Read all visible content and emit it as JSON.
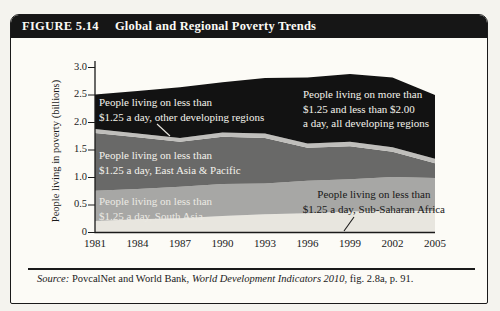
{
  "figure": {
    "label": "FIGURE 5.14",
    "title": "Global and Regional Poverty Trends"
  },
  "chart_data": {
    "type": "area",
    "stacked": true,
    "title": "Global and Regional Poverty Trends",
    "xlabel": "",
    "ylabel": "People living in poverty (billions)",
    "x": [
      1981,
      1984,
      1987,
      1990,
      1993,
      1996,
      1999,
      2002,
      2005
    ],
    "ylim": [
      0,
      3.0
    ],
    "yticks": [
      {
        "value": 0,
        "label": "0"
      },
      {
        "value": 0.5,
        "label": "0.5"
      },
      {
        "value": 1.0,
        "label": "1.0"
      },
      {
        "value": 1.5,
        "label": "1.5"
      },
      {
        "value": 2.0,
        "label": "2.0"
      },
      {
        "value": 2.5,
        "label": "2.5"
      },
      {
        "value": 3.0,
        "label": "3.0"
      }
    ],
    "grid": false,
    "legend": "labels-inside-areas",
    "series": [
      {
        "name": "sub-saharan-africa",
        "label": "People living on less than\n$1.25 a day, Sub-Saharan Africa",
        "color": "#e8e6df",
        "values": [
          0.21,
          0.24,
          0.26,
          0.3,
          0.33,
          0.35,
          0.38,
          0.39,
          0.39
        ]
      },
      {
        "name": "south-asia",
        "label": "People living on less than\n$1.25 a day, South Asia",
        "color": "#a7a7a5",
        "values": [
          0.55,
          0.55,
          0.57,
          0.58,
          0.56,
          0.59,
          0.59,
          0.62,
          0.6
        ]
      },
      {
        "name": "east-asia-pacific",
        "label": "People living on less than\n$1.25 a day, East Asia & Pacific",
        "color": "#696968",
        "values": [
          1.05,
          0.94,
          0.82,
          0.86,
          0.83,
          0.6,
          0.6,
          0.46,
          0.27
        ]
      },
      {
        "name": "other-developing-regions",
        "label": "People living on less than\n$1.25 a day, other developing regions",
        "color": "#bfbebb",
        "values": [
          0.07,
          0.07,
          0.07,
          0.08,
          0.08,
          0.08,
          0.08,
          0.08,
          0.08
        ]
      },
      {
        "name": "between-1.25-and-2.00-all-developing",
        "label": "People living on more than\n$1.25 and less than $2.00\na day, all developing regions",
        "color": "#121212",
        "values": [
          0.63,
          0.77,
          0.92,
          0.91,
          1.01,
          1.2,
          1.23,
          1.27,
          1.16
        ]
      }
    ]
  },
  "source": {
    "prefix": "Source:",
    "text1": " PovcalNet and World Bank, ",
    "italic": "World Development Indicators 2010",
    "text2": ", fig. 2.8a, p. 91."
  }
}
